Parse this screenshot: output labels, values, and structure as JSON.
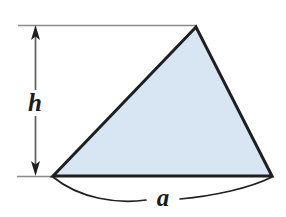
{
  "figure": {
    "background_color": "#ffffff",
    "shape": {
      "name": "triangle",
      "fill_color": "#d7e6f2",
      "stroke_color": "#1f1f1f",
      "stroke_width": 3,
      "vertices": [
        {
          "label": "bottom-left",
          "x": 53,
          "y": 176
        },
        {
          "label": "apex",
          "x": 196,
          "y": 27
        },
        {
          "label": "bottom-right",
          "x": 272,
          "y": 176
        }
      ]
    },
    "dimensions": [
      {
        "name": "height",
        "symbol": "h",
        "orientation": "vertical",
        "line_color": "#555555",
        "arrow_color": "#1f1f1f",
        "from": {
          "x": 35,
          "y": 26
        },
        "to": {
          "x": 35,
          "y": 175
        }
      },
      {
        "name": "base",
        "symbol": "a",
        "orientation": "arc",
        "line_color": "#1f1f1f",
        "from": {
          "x": 53,
          "y": 177
        },
        "to": {
          "x": 272,
          "y": 177
        }
      }
    ],
    "reference_lines": [
      {
        "name": "top-extension-line",
        "x1": 18,
        "y1": 25,
        "x2": 197,
        "y2": 25,
        "color": "#7a7a7a"
      },
      {
        "name": "bottom-extension-line",
        "x1": 17,
        "y1": 176,
        "x2": 56,
        "y2": 176,
        "color": "#7a7a7a"
      }
    ],
    "labels": {
      "height_symbol": "h",
      "base_symbol": "a"
    }
  }
}
